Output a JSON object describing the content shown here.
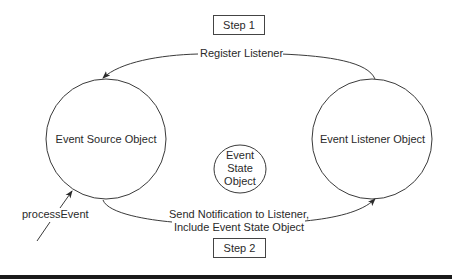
{
  "diagram": {
    "steps": {
      "step1": "Step 1",
      "step2": "Step 2"
    },
    "nodes": {
      "source": "Event Source Object",
      "listener": "Event Listener Object",
      "state": {
        "line1": "Event",
        "line2": "State",
        "line3": "Object"
      }
    },
    "edges": {
      "register": "Register Listener",
      "notify_line1": "Send Notification to Listener,",
      "notify_line2": "Include Event State Object",
      "process": "processEvent"
    },
    "colors": {
      "stroke": "#3a3a3a",
      "text": "#2a2a2a",
      "bar": "#1a1a1a"
    }
  }
}
